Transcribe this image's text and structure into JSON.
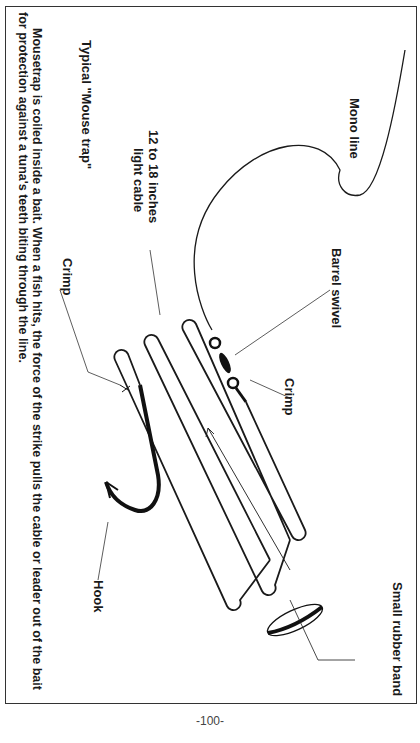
{
  "figure": {
    "title": "Typical \"Mouse trap\"",
    "labels": {
      "mono_line": "Mono line",
      "barrel_swivel": "Barrel swivel",
      "crimp_top": "Crimp",
      "crimp_bottom": "Crimp",
      "cable": "12 to 18 inches",
      "cable_line2": "light cable",
      "rubber_band": "Small rubber band",
      "hook": "Hook"
    },
    "caption_line1": "Mousetrap is coiled inside a bait. When a fish hits, the force of the strike pulls the cable or leader out of the bait",
    "caption_line2": "for protection against a tuna's teeth biting through the line."
  },
  "page_number": "-100-",
  "colors": {
    "ink": "#1a1a1a",
    "background": "#ffffff"
  }
}
